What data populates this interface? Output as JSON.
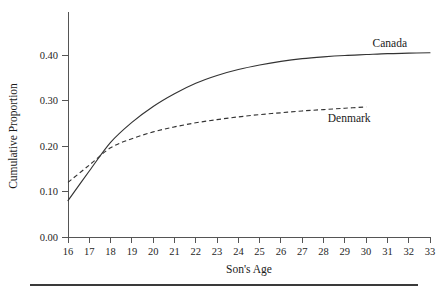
{
  "chart_data": {
    "type": "line",
    "title": "",
    "xlabel": "Son's Age",
    "ylabel": "Cumulative Proportion",
    "xlim": [
      16,
      33
    ],
    "ylim": [
      0.0,
      0.44
    ],
    "xticks": [
      16,
      17,
      18,
      19,
      20,
      21,
      22,
      23,
      24,
      25,
      26,
      27,
      28,
      29,
      30,
      31,
      32,
      33
    ],
    "xtick_labels": [
      "16",
      "17",
      "18",
      "19",
      "20",
      "21",
      "22",
      "23",
      "24",
      "25",
      "26",
      "27",
      "28",
      "29",
      "30",
      "31",
      "32",
      "33"
    ],
    "yticks": [
      0.0,
      0.1,
      0.2,
      0.3,
      0.4
    ],
    "ytick_labels": [
      "0.00",
      "0.10",
      "0.20",
      "0.30",
      "0.40"
    ],
    "grid": false,
    "legend_position": "inline-right-of-curves",
    "series": [
      {
        "name": "Canada",
        "style": "solid",
        "color": "#333333",
        "label_x": 30.3,
        "label_y": 0.418,
        "x": [
          16,
          17,
          18,
          19,
          20,
          21,
          22,
          23,
          24,
          25,
          26,
          27,
          28,
          29,
          30,
          31,
          32,
          33
        ],
        "values": [
          0.08,
          0.145,
          0.208,
          0.252,
          0.287,
          0.315,
          0.338,
          0.355,
          0.368,
          0.378,
          0.386,
          0.392,
          0.396,
          0.399,
          0.401,
          0.403,
          0.404,
          0.405
        ]
      },
      {
        "name": "Denmark",
        "style": "dashed",
        "color": "#333333",
        "label_x": 28.2,
        "label_y": 0.252,
        "x": [
          16,
          17,
          18,
          19,
          20,
          21,
          22,
          23,
          24,
          25,
          26,
          27,
          28,
          29,
          30
        ],
        "values": [
          0.12,
          0.158,
          0.196,
          0.216,
          0.231,
          0.242,
          0.251,
          0.258,
          0.264,
          0.269,
          0.273,
          0.277,
          0.28,
          0.283,
          0.286
        ]
      }
    ],
    "annotations": []
  },
  "figure": {
    "background_color": "#ffffff",
    "axis_color": "#555555",
    "footer_rule_color": "#3a3a3a"
  }
}
